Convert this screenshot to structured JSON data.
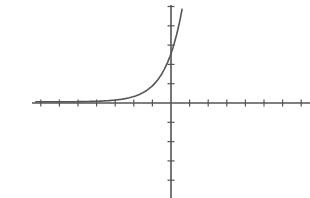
{
  "chart_data": {
    "type": "line",
    "title": "",
    "xlabel": "",
    "ylabel": "",
    "grid": false,
    "legend": null,
    "function_description": "exponential growth curve, approx y = 2.5 * 3^x, horizontal asymptote y = 0",
    "xlim": [
      -7,
      7
    ],
    "ylim": [
      -4,
      5
    ],
    "x_ticks": [
      -7,
      -6,
      -5,
      -4,
      -3,
      -2,
      -1,
      1,
      2,
      3,
      4,
      5,
      6,
      7
    ],
    "y_ticks": [
      -4,
      -3,
      -2,
      -1,
      1,
      2,
      3,
      4,
      5
    ],
    "series": [
      {
        "name": "curve",
        "x": [
          -7.3,
          -6,
          -5,
          -4,
          -3,
          -2,
          -1.5,
          -1,
          -0.5,
          0,
          0.25,
          0.5,
          0.6
        ],
        "y": [
          0.08,
          0.01,
          0.01,
          0.03,
          0.09,
          0.28,
          0.48,
          0.83,
          1.44,
          2.5,
          3.29,
          4.33,
          4.9
        ]
      }
    ],
    "colors": {
      "axes": "#555555",
      "curve": "#555555",
      "background": "#ffffff"
    }
  },
  "layout": {
    "origin_px": [
      171,
      103
    ],
    "unit_x_px": 18.6,
    "unit_y_px": 19.3,
    "x_axis_px": [
      32,
      310
    ],
    "y_axis_px": [
      5,
      198
    ]
  }
}
